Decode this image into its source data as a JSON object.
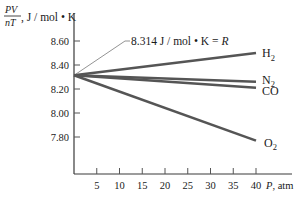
{
  "chart_data": {
    "type": "line",
    "title": "",
    "ylabel": {
      "fraction_numerator": "PV",
      "fraction_denominator": "nT",
      "units": ", J / mol • K"
    },
    "xlabel": "P, atm",
    "xlabel_var": "P",
    "xlabel_units": ", atm",
    "xlim": [
      0,
      45
    ],
    "ylim": [
      7.6,
      8.7
    ],
    "x_ticks": [
      5,
      10,
      15,
      20,
      25,
      30,
      35,
      40
    ],
    "x_tick_labels": [
      "5",
      "10",
      "15",
      "20",
      "25",
      "30",
      "35",
      "40"
    ],
    "y_ticks": [
      8.6,
      8.4,
      8.2,
      8.0,
      7.8
    ],
    "y_tick_labels": [
      "8.60",
      "8.40",
      "8.20",
      "8.00",
      "7.80"
    ],
    "grid": false,
    "legend": "inline labels at line ends",
    "x": [
      0,
      40
    ],
    "series": [
      {
        "name": "H2",
        "label_main": "H",
        "label_sub": "2",
        "values": [
          8.314,
          8.5
        ]
      },
      {
        "name": "N2",
        "label_main": "N",
        "label_sub": "2",
        "values": [
          8.314,
          8.26
        ]
      },
      {
        "name": "CO",
        "label_main": "CO",
        "label_sub": "",
        "values": [
          8.314,
          8.21
        ]
      },
      {
        "name": "O2",
        "label_main": "O",
        "label_sub": "2",
        "values": [
          8.314,
          7.77
        ]
      }
    ],
    "annotations": [
      {
        "text_value": "8.314 J / mol • K = ",
        "text_symbol": "R",
        "points_to": {
          "x": 0,
          "y": 8.314
        }
      }
    ]
  }
}
